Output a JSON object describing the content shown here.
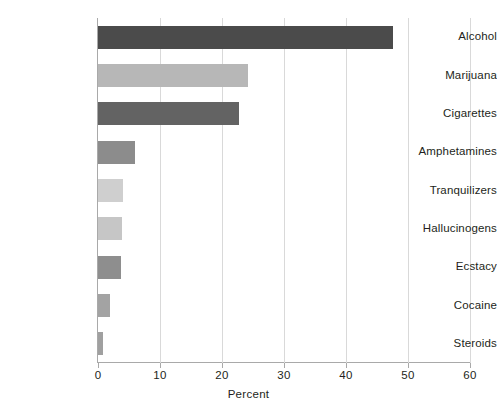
{
  "chart_data": {
    "type": "bar",
    "orientation": "horizontal",
    "title": "",
    "subtitle": "",
    "xlabel": "Percent",
    "ylabel": "",
    "xlim": [
      0,
      60
    ],
    "xticks": [
      0,
      10,
      20,
      30,
      40,
      50,
      60
    ],
    "xtick_labels": [
      "0",
      "10",
      "20",
      "30",
      "40",
      "50",
      "60"
    ],
    "grid": "vertical",
    "legend": "none",
    "categories": [
      "Alcohol",
      "Marijuana",
      "Cigarettes",
      "Amphetamines",
      "Tranquilizers",
      "Hallucinogens",
      "Ecstacy",
      "Cocaine",
      "Steroids"
    ],
    "values": [
      47.5,
      24.2,
      22.7,
      6.0,
      4.1,
      3.8,
      3.7,
      2.0,
      0.8
    ],
    "bar_colors": [
      "#4b4b4b",
      "#b7b7b7",
      "#636363",
      "#8c8c8c",
      "#cfcfcf",
      "#c6c6c6",
      "#8e8e8e",
      "#a3a3a3",
      "#a0a0a0"
    ]
  },
  "style": {
    "background": "#ffffff",
    "axis_color": "#a9a9a9",
    "grid_color": "#d9d9d9",
    "text_color": "#231f20"
  }
}
